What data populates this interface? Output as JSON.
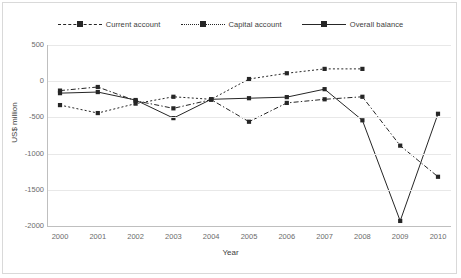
{
  "chart_data": {
    "type": "line",
    "title": "",
    "xlabel": "Year",
    "ylabel": "US$ million",
    "categories": [
      "2000",
      "2001",
      "2002",
      "2003",
      "2004",
      "2005",
      "2006",
      "2007",
      "2008",
      "2009",
      "2010"
    ],
    "x": [
      2000,
      2001,
      2002,
      2003,
      2004,
      2005,
      2006,
      2007,
      2008,
      2009,
      2010
    ],
    "xlim": [
      2000,
      2010
    ],
    "ylim": [
      -2000,
      500
    ],
    "yticks": [
      500,
      0,
      -500,
      -1000,
      -1500,
      -2000
    ],
    "ytick_labels": [
      "500",
      "0",
      "-500",
      "-1000",
      "-1500",
      "-2000"
    ],
    "grid": true,
    "legend_position": "top-center",
    "series": [
      {
        "name": "Current account",
        "style": "dash-dot",
        "marker": "square",
        "color": "#262626",
        "values": [
          -130,
          -80,
          -270,
          -375,
          -255,
          -560,
          -300,
          -250,
          -215,
          -890,
          -1320
        ]
      },
      {
        "name": "Capital account",
        "style": "dotted",
        "marker": "square",
        "color": "#262626",
        "values": [
          -330,
          -440,
          -310,
          -215,
          -250,
          30,
          110,
          170,
          170,
          null,
          null
        ]
      },
      {
        "name": "Overall balance",
        "style": "solid",
        "marker": "square",
        "color": "#262626",
        "values": [
          -165,
          -150,
          -260,
          -510,
          -250,
          -235,
          -220,
          -110,
          -540,
          -1930,
          -450
        ]
      }
    ]
  },
  "legend": {
    "items": [
      {
        "label": "Current account",
        "key": "dash-dot-line-key"
      },
      {
        "label": "Capital account",
        "key": "dotted-line-key"
      },
      {
        "label": "Overall balance",
        "key": "solid-line-key"
      }
    ]
  },
  "axes": {
    "y_title": "US$ million",
    "x_title": "Year",
    "y_labels": [
      "500",
      "0",
      "-500",
      "-1000",
      "-1500",
      "-2000"
    ],
    "x_labels": [
      "2000",
      "2001",
      "2002",
      "2003",
      "2004",
      "2005",
      "2006",
      "2007",
      "2008",
      "2009",
      "2010"
    ]
  }
}
